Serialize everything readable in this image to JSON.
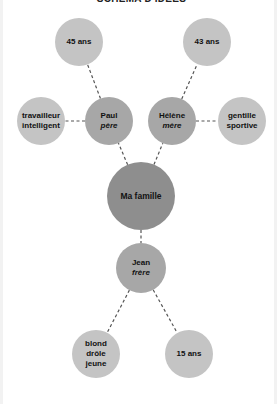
{
  "title": "SCHÉMA D'IDÉES",
  "colors": {
    "attribute_node": "#c4c4c4",
    "person_node": "#a7a7a7",
    "center_node": "#8e8e8e",
    "link": "#555555",
    "text": "#111111"
  },
  "center": {
    "id": "famille",
    "label": "Ma famille",
    "cx": 138,
    "cy": 196,
    "r": 34
  },
  "persons": [
    {
      "id": "paul",
      "name": "Paul",
      "role": "père",
      "cx": 106,
      "cy": 121,
      "r": 24
    },
    {
      "id": "helene",
      "name": "Hélène",
      "role": "mère",
      "cx": 169,
      "cy": 121,
      "r": 24
    },
    {
      "id": "jean",
      "name": "Jean",
      "role": "frère",
      "cx": 138,
      "cy": 268,
      "r": 25
    }
  ],
  "attributes": [
    {
      "id": "paul-age",
      "parent": "paul",
      "lines": [
        "45 ans"
      ],
      "cx": 76,
      "cy": 42,
      "r": 24
    },
    {
      "id": "paul-trait",
      "parent": "paul",
      "lines": [
        "travailleur",
        "intelligent"
      ],
      "cx": 38,
      "cy": 121,
      "r": 24
    },
    {
      "id": "helene-age",
      "parent": "helene",
      "lines": [
        "43 ans"
      ],
      "cx": 204,
      "cy": 42,
      "r": 24
    },
    {
      "id": "helene-trait",
      "parent": "helene",
      "lines": [
        "gentille",
        "sportive"
      ],
      "cx": 239,
      "cy": 121,
      "r": 24
    },
    {
      "id": "jean-trait",
      "parent": "jean",
      "lines": [
        "blond",
        "drôle",
        "jeune"
      ],
      "cx": 93,
      "cy": 354,
      "r": 24
    },
    {
      "id": "jean-age",
      "parent": "jean",
      "lines": [
        "15 ans"
      ],
      "cx": 186,
      "cy": 354,
      "r": 24
    }
  ],
  "links": [
    {
      "from": "famille",
      "to": "paul"
    },
    {
      "from": "famille",
      "to": "helene"
    },
    {
      "from": "famille",
      "to": "jean"
    },
    {
      "from": "paul",
      "to": "paul-age"
    },
    {
      "from": "paul",
      "to": "paul-trait"
    },
    {
      "from": "helene",
      "to": "helene-age"
    },
    {
      "from": "helene",
      "to": "helene-trait"
    },
    {
      "from": "jean",
      "to": "jean-trait"
    },
    {
      "from": "jean",
      "to": "jean-age"
    }
  ]
}
